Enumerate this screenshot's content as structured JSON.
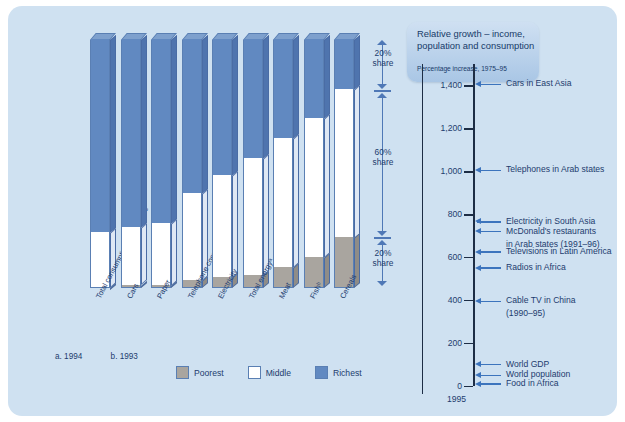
{
  "chart_data": {
    "type": "bar",
    "title": "Relative growth – income, population and consumption",
    "subtitle": "Percentage increase, 1975–95",
    "categories": [
      "Total consumption expenditure",
      "Cars",
      "Paper",
      "Telephone connections",
      "Electricity",
      "Total energyᵃ",
      "Meat",
      "Fishᵇ",
      "Cereals"
    ],
    "series": [
      {
        "name": "Richest",
        "color": "#6189c1",
        "values": [
          78,
          76,
          74,
          62,
          55,
          48,
          40,
          32,
          20
        ]
      },
      {
        "name": "Middle",
        "color": "#ffffff",
        "values": [
          22,
          23,
          25,
          35,
          41,
          47,
          52,
          56,
          60
        ]
      },
      {
        "name": "Poorest",
        "color": "#a9a59f",
        "values": [
          0,
          1,
          1,
          3,
          4,
          5,
          8,
          12,
          20
        ]
      }
    ],
    "stacked": true,
    "ylabel": "Share of world consumption (%)",
    "ylim": [
      0,
      100
    ],
    "share_annotations": [
      {
        "label": "20%",
        "label2": "share",
        "range": [
          80,
          100
        ]
      },
      {
        "label": "60%",
        "label2": "share",
        "range": [
          20,
          80
        ]
      },
      {
        "label": "20%",
        "label2": "share",
        "range": [
          0,
          20
        ]
      }
    ],
    "legend": [
      {
        "label": "Poorest",
        "color": "#a9a59f"
      },
      {
        "label": "Middle",
        "color": "#ffffff"
      },
      {
        "label": "Richest",
        "color": "#6189c1"
      }
    ],
    "footnotes": [
      "a. 1994",
      "b. 1993"
    ],
    "growth_axis": {
      "ticks": [
        "1,400",
        "1,200",
        "1,000",
        "800",
        "600",
        "400",
        "200",
        "0"
      ],
      "tick_values": [
        1400,
        1200,
        1000,
        800,
        600,
        400,
        200,
        0
      ],
      "ylim": [
        0,
        1500
      ],
      "baseline_year": "1995",
      "annotations": [
        {
          "label": "Cars in East Asia",
          "value": 1400
        },
        {
          "label": "Telephones in Arab states",
          "value": 1000
        },
        {
          "label": "Electricity in South Asia",
          "value": 760
        },
        {
          "label": "McDonald's restaurants",
          "value": 715,
          "continuation": "in Arab states (1991–96)"
        },
        {
          "label": "Televisions in Latin America",
          "value": 620
        },
        {
          "label": "Radios in Africa",
          "value": 545
        },
        {
          "label": "Cable TV in China",
          "value": 390,
          "continuation": "(1990–95)"
        },
        {
          "label": "World GDP",
          "value": 95
        },
        {
          "label": "World population",
          "value": 45
        },
        {
          "label": "Food in Africa",
          "value": 5
        }
      ]
    }
  },
  "colors": {
    "panel": "#cfe1f1",
    "richest": "#6189c1",
    "middle": "#ffffff",
    "poorest": "#a9a59f",
    "axis": "#1d2d45",
    "arrow": "#3c74bd",
    "text": "#1d3c6e"
  }
}
